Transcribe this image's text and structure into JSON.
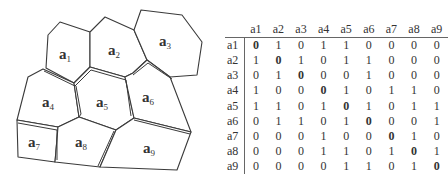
{
  "diagram": {
    "regions": [
      {
        "id": "a1",
        "letter": "a",
        "sub": "1"
      },
      {
        "id": "a2",
        "letter": "a",
        "sub": "2"
      },
      {
        "id": "a3",
        "letter": "a",
        "sub": "3"
      },
      {
        "id": "a4",
        "letter": "a",
        "sub": "4"
      },
      {
        "id": "a5",
        "letter": "a",
        "sub": "5"
      },
      {
        "id": "a6",
        "letter": "a",
        "sub": "6"
      },
      {
        "id": "a7",
        "letter": "a",
        "sub": "7"
      },
      {
        "id": "a8",
        "letter": "a",
        "sub": "8"
      },
      {
        "id": "a9",
        "letter": "a",
        "sub": "9"
      }
    ]
  },
  "matrix": {
    "columns": [
      "a1",
      "a2",
      "a3",
      "a4",
      "a5",
      "a6",
      "a7",
      "a8",
      "a9"
    ],
    "rows": [
      {
        "label": "a1",
        "values": [
          "0",
          "1",
          "0",
          "1",
          "1",
          "0",
          "0",
          "0",
          "0"
        ]
      },
      {
        "label": "a2",
        "values": [
          "1",
          "0",
          "1",
          "0",
          "1",
          "1",
          "0",
          "0",
          "0"
        ]
      },
      {
        "label": "a3",
        "values": [
          "0",
          "1",
          "0",
          "0",
          "0",
          "1",
          "0",
          "0",
          "0"
        ]
      },
      {
        "label": "a4",
        "values": [
          "1",
          "0",
          "0",
          "0",
          "1",
          "0",
          "1",
          "1",
          "0"
        ]
      },
      {
        "label": "a5",
        "values": [
          "1",
          "1",
          "0",
          "1",
          "0",
          "1",
          "0",
          "1",
          "1"
        ]
      },
      {
        "label": "a6",
        "values": [
          "0",
          "1",
          "1",
          "0",
          "1",
          "0",
          "0",
          "0",
          "1"
        ]
      },
      {
        "label": "a7",
        "values": [
          "0",
          "0",
          "0",
          "1",
          "0",
          "0",
          "0",
          "1",
          "0"
        ]
      },
      {
        "label": "a8",
        "values": [
          "0",
          "0",
          "0",
          "1",
          "1",
          "0",
          "1",
          "0",
          "1"
        ]
      },
      {
        "label": "a9",
        "values": [
          "0",
          "0",
          "0",
          "0",
          "1",
          "1",
          "0",
          "1",
          "0"
        ]
      }
    ]
  }
}
